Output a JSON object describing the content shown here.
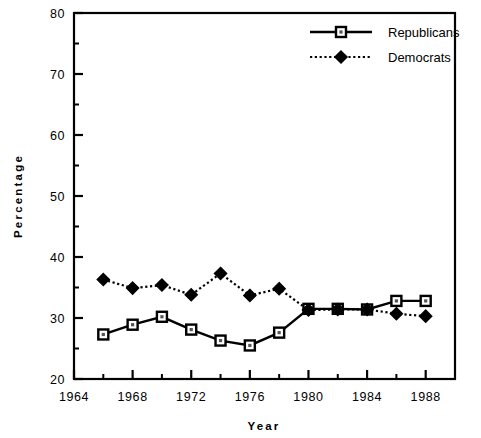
{
  "chart_data": {
    "type": "line",
    "title": "",
    "xlabel": "Year",
    "ylabel": "Percentage",
    "xlim": [
      1964,
      1990
    ],
    "ylim": [
      20,
      80
    ],
    "grid": false,
    "legend_position": "top-right",
    "x_major_ticks": [
      1964,
      1968,
      1972,
      1976,
      1980,
      1984,
      1988
    ],
    "x_minor_ticks": [
      1966,
      1970,
      1974,
      1978,
      1982,
      1986,
      1990
    ],
    "x_tick_labels": [
      "1964",
      "1968",
      "1972",
      "1976",
      "1980",
      "1984",
      "1988"
    ],
    "y_major_ticks": [
      20,
      30,
      40,
      50,
      60,
      70,
      80
    ],
    "y_minor_ticks": [
      25,
      35,
      45,
      55,
      65,
      75
    ],
    "y_tick_labels": [
      "20",
      "30",
      "40",
      "50",
      "60",
      "70",
      "80"
    ],
    "x": [
      1966,
      1968,
      1970,
      1972,
      1974,
      1976,
      1978,
      1980,
      1982,
      1984,
      1986,
      1988
    ],
    "series": [
      {
        "name": "Republicans",
        "marker": "open-square",
        "line_style": "solid",
        "color": "#000000",
        "values": [
          27.3,
          28.9,
          30.2,
          28.1,
          26.3,
          25.5,
          27.6,
          31.5,
          31.5,
          31.4,
          32.8,
          32.8
        ]
      },
      {
        "name": "Democrats",
        "marker": "filled-diamond",
        "line_style": "dotted",
        "color": "#000000",
        "values": [
          36.3,
          34.9,
          35.4,
          33.8,
          37.3,
          33.7,
          34.8,
          31.3,
          31.4,
          31.4,
          30.7,
          30.3
        ]
      }
    ]
  },
  "legend": {
    "entries": [
      {
        "label": "Republicans"
      },
      {
        "label": "Democrats"
      }
    ]
  },
  "axes": {
    "x_title": "Year",
    "y_title": "Percentage"
  }
}
